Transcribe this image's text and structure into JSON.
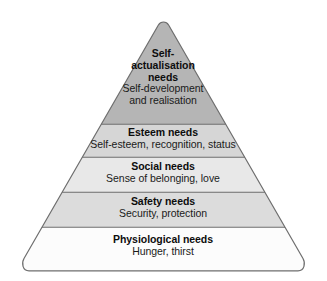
{
  "diagram": {
    "type": "pyramid",
    "name": "maslow-hierarchy-of-needs",
    "orientation": "apex-top",
    "tier_count": 5,
    "colors": {
      "outline": "#6e6e6e",
      "text": "#111111",
      "background": "#ffffff",
      "tier_1_fill": "#b5b5b5",
      "tier_2_fill": "#d6d6d6",
      "tier_3_fill": "#e8e8e8",
      "tier_4_fill": "#dcdcdc",
      "tier_5_fill": "#fcfcfc"
    },
    "tiers": [
      {
        "level": 1,
        "position": "top",
        "title": "Self-actualisation needs",
        "title_lines": [
          "Self-",
          "actualisation",
          "needs"
        ],
        "description": "Self-development and realisation",
        "description_lines": [
          "Self-development",
          "and realisation"
        ],
        "fill": "#b5b5b5"
      },
      {
        "level": 2,
        "position": "second",
        "title": "Esteem needs",
        "title_lines": [
          "Esteem needs"
        ],
        "description": "Self-esteem, recognition, status",
        "description_lines": [
          "Self-esteem, recognition, status"
        ],
        "fill": "#d6d6d6"
      },
      {
        "level": 3,
        "position": "middle",
        "title": "Social needs",
        "title_lines": [
          "Social needs"
        ],
        "description": "Sense of belonging, love",
        "description_lines": [
          "Sense of belonging, love"
        ],
        "fill": "#e8e8e8"
      },
      {
        "level": 4,
        "position": "fourth",
        "title": "Safety needs",
        "title_lines": [
          "Safety needs"
        ],
        "description": "Security, protection",
        "description_lines": [
          "Security, protection"
        ],
        "fill": "#dcdcdc"
      },
      {
        "level": 5,
        "position": "base",
        "title": "Physiological needs",
        "title_lines": [
          "Physiological needs"
        ],
        "description": "Hunger, thirst",
        "description_lines": [
          "Hunger, thirst"
        ],
        "fill": "#fcfcfc"
      }
    ]
  }
}
